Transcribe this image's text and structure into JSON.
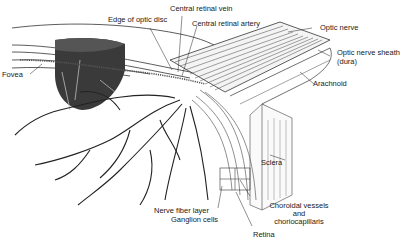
{
  "figure": {
    "labels": {
      "fovea": "Fovea",
      "edge_optic_disc": "Edge of optic disc",
      "central_retinal_vein": "Central retinal vein",
      "central_retinal_artery": "Central retinal artery",
      "optic_nerve": "Optic nerve",
      "optic_nerve_sheath_line1": "Optic nerve sheath",
      "optic_nerve_sheath_line2": "(dura)",
      "arachnoid": "Arachnoid",
      "sclera": "Sclera",
      "choroidal_line1": "Choroidal vessels",
      "choroidal_line2": "and",
      "choroidal_line3": "choriocapillaris",
      "nerve_fiber_layer": "Nerve fiber layer",
      "ganglion_cells": "Ganglion cells",
      "retina": "Retina"
    },
    "colors": {
      "ink": "#1a1a1a",
      "dark_block": "#3a3a3a",
      "mid_gray": "#7a7a7a",
      "background": "#ffffff"
    }
  }
}
